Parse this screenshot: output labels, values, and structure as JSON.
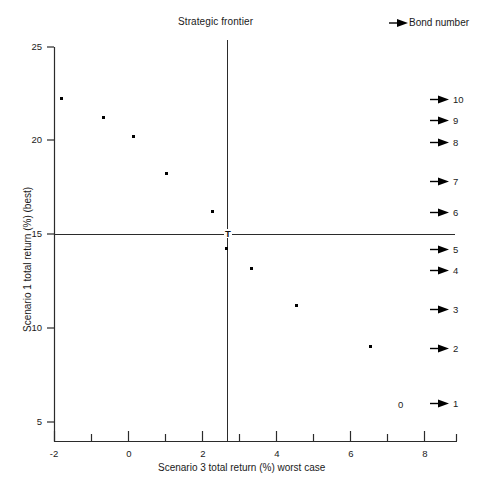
{
  "chart_data": {
    "type": "scatter",
    "title": "Strategic frontier",
    "xlabel": "Scenario 3 total return (%) worst case",
    "ylabel": "Scenario 1 total return (%) (best)",
    "xlim": [
      -2,
      8.9
    ],
    "ylim": [
      3.9,
      25
    ],
    "xticks": [
      -2,
      0,
      2,
      4,
      6,
      8
    ],
    "xtick_labels": [
      "-2",
      "0",
      "2",
      "4",
      "6",
      "8"
    ],
    "yticks": [
      5,
      10,
      15,
      20,
      25
    ],
    "ytick_labels": [
      "5",
      "10",
      "15",
      "20",
      "25"
    ],
    "x_minor_ticks": [
      -1,
      1,
      3,
      5,
      7
    ],
    "grid": false,
    "legend": "Bond number",
    "series": [
      {
        "name": "Bonds",
        "points": [
          {
            "bond": "10",
            "x": -1.7,
            "y": 22.0
          },
          {
            "bond": "9",
            "x": -0.55,
            "y": 21.0
          },
          {
            "bond": "8",
            "x": 0.25,
            "y": 19.95
          },
          {
            "bond": "7",
            "x": 1.15,
            "y": 18.0
          },
          {
            "bond": "6",
            "x": 2.4,
            "y": 16.0
          },
          {
            "bond": "5",
            "x": 2.77,
            "y": 14.0
          },
          {
            "bond": "4",
            "x": 3.45,
            "y": 12.95
          },
          {
            "bond": "3",
            "x": 4.65,
            "y": 10.95
          },
          {
            "bond": "2",
            "x": 6.65,
            "y": 8.85
          }
        ]
      }
    ],
    "reference_lines": [
      {
        "name": "strategic-frontier-vertical",
        "orientation": "vertical",
        "value": 2.77
      },
      {
        "name": "strategic-frontier-horizontal",
        "orientation": "horizontal",
        "value": 15.0
      }
    ],
    "annotations": [
      {
        "name": "frontier-intersection-marker",
        "text": "T",
        "x": 2.77,
        "y": 15.0
      },
      {
        "name": "zero-annotation",
        "text": "0",
        "x": 7.37,
        "y": 5.95
      }
    ],
    "bond_legend_entries": [
      {
        "label": "10",
        "y_px": 100
      },
      {
        "label": "9",
        "y_px": 121
      },
      {
        "label": "8",
        "y_px": 143
      },
      {
        "label": "7",
        "y_px": 182
      },
      {
        "label": "6",
        "y_px": 213
      },
      {
        "label": "5",
        "y_px": 250
      },
      {
        "label": "4",
        "y_px": 271
      },
      {
        "label": "3",
        "y_px": 310
      },
      {
        "label": "2",
        "y_px": 349
      },
      {
        "label": "1",
        "y_px": 404
      }
    ],
    "colors": {
      "axis": "#2b2b2b",
      "marker": "#000000",
      "text": "#1a1a1a",
      "background": "#ffffff"
    }
  }
}
